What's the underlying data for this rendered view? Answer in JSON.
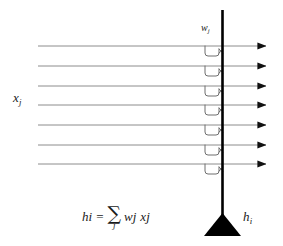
{
  "diagram": {
    "colors": {
      "background": "#ffffff",
      "input_line": "#8c8c8c",
      "axon_bar": "#000000",
      "synapse_hook": "#6e6e6e",
      "arrowhead": "#111111",
      "text": "#1a1a1a"
    },
    "labels": {
      "inputs": {
        "base": "x",
        "sub": "j",
        "text": "x j"
      },
      "weights": {
        "base": "w",
        "sub": "j",
        "text": "w j"
      },
      "output": {
        "base": "h",
        "sub": "i",
        "text": "h i"
      }
    },
    "formula": {
      "lhs_base": "h",
      "lhs_sub": "i",
      "equals": "=",
      "sigma": "∑",
      "sigma_index": "j",
      "term1_base": "w",
      "term1_sub": "j",
      "term2_base": "x",
      "term2_sub": "j",
      "plain": "h_i = sum_j w_j x_j"
    },
    "geometry": {
      "width": 283,
      "height": 246,
      "line_count": 7,
      "line_x_start": 38,
      "line_x_end": 272,
      "bar_x": 222,
      "bar_top": 10,
      "bar_bottom": 218,
      "line_y": [
        46,
        66,
        86,
        105,
        125,
        145,
        164
      ]
    }
  }
}
